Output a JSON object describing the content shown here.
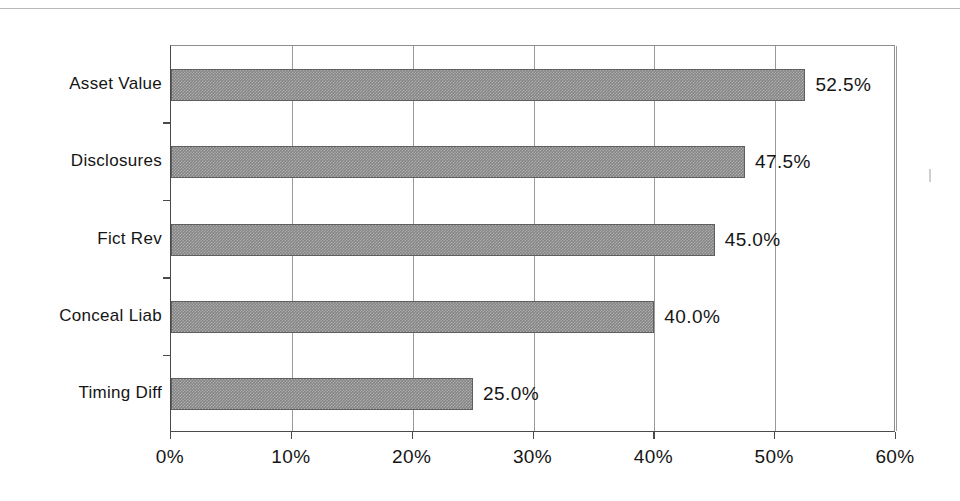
{
  "chart_data": {
    "type": "bar",
    "orientation": "horizontal",
    "title": "",
    "subtitle": "",
    "xlabel": "",
    "ylabel": "",
    "categories": [
      "Asset Value",
      "Disclosures",
      "Fict Rev",
      "Conceal Liab",
      "Timing Diff"
    ],
    "values": [
      52.5,
      47.5,
      45.0,
      40.0,
      25.0
    ],
    "data_labels": [
      "52.5%",
      "47.5%",
      "45.0%",
      "40.0%",
      "25.0%"
    ],
    "xlim": [
      0,
      60
    ],
    "xticks": [
      0,
      10,
      20,
      30,
      40,
      50,
      60
    ],
    "xtick_labels": [
      "0%",
      "10%",
      "20%",
      "30%",
      "40%",
      "50%",
      "60%"
    ],
    "grid": "vertical",
    "legend": "none",
    "bar_color": "#858585",
    "bar_edge_color": "#5e5e5e",
    "axis_color": "#4a4a4a",
    "gridline_color": "#9a9a9a",
    "background": "#ffffff"
  },
  "axis": {
    "x_tick_labels": [
      "0%",
      "10%",
      "20%",
      "30%",
      "40%",
      "50%",
      "60%"
    ],
    "category_labels": [
      "Asset Value",
      "Disclosures",
      "Fict Rev",
      "Conceal Liab",
      "Timing Diff"
    ]
  },
  "series": {
    "bars": [
      {
        "label": "Asset Value",
        "value": 52.5,
        "text": "52.5%"
      },
      {
        "label": "Disclosures",
        "value": 47.5,
        "text": "47.5%"
      },
      {
        "label": "Fict Rev",
        "value": 45.0,
        "text": "45.0%"
      },
      {
        "label": "Conceal Liab",
        "value": 40.0,
        "text": "40.0%"
      },
      {
        "label": "Timing Diff",
        "value": 25.0,
        "text": "25.0%"
      }
    ]
  }
}
